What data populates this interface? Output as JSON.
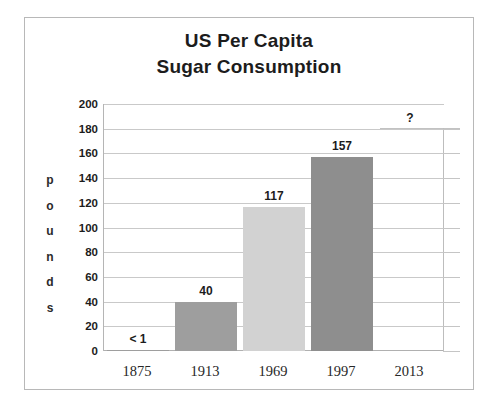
{
  "chart_data": {
    "type": "bar",
    "title": "US Per Capita Sugar Consumption",
    "title_lines": [
      "US Per Capita",
      "Sugar Consumption"
    ],
    "xlabel": "",
    "ylabel": "pounds",
    "ylabel_letters": [
      "p",
      "o",
      "u",
      "n",
      "d",
      "s"
    ],
    "categories": [
      "1875",
      "1913",
      "1969",
      "1997",
      "2013"
    ],
    "values": [
      0.5,
      40,
      117,
      157,
      null
    ],
    "data_labels": [
      "< 1",
      "40",
      "117",
      "157",
      "?"
    ],
    "ylim": [
      0,
      200
    ],
    "yticks": [
      200,
      180,
      160,
      140,
      120,
      100,
      80,
      60,
      40,
      20,
      0
    ],
    "ytick_labels": [
      "200",
      "180",
      "160",
      "140",
      "120",
      "100",
      "80",
      "60",
      "40",
      "20",
      "0"
    ],
    "grid": true,
    "legend": false,
    "bar_colors": [
      "#9e9e9e",
      "#9e9e9e",
      "#d2d2d2",
      "#8e8e8e",
      "#ffffff"
    ],
    "colors": {
      "bar_dark": "#9e9e9e",
      "bar_light": "#d2d2d2",
      "bar_darker": "#8e8e8e",
      "gridline": "#c9c9c9",
      "frame": "#b8b8b8",
      "text": "#1c1c1c",
      "background": "#ffffff"
    }
  }
}
